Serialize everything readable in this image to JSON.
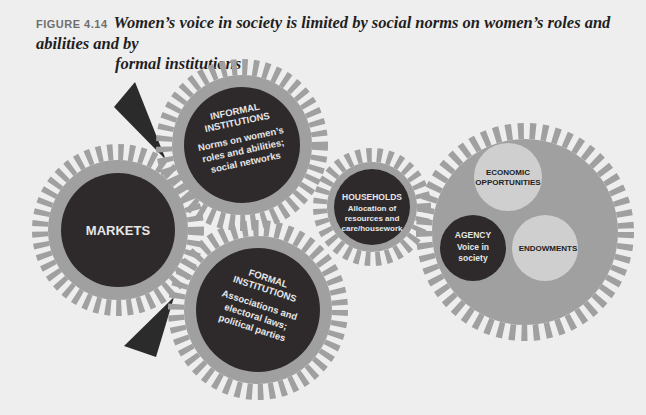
{
  "figure": {
    "label": "FIGURE 4.14",
    "caption_line1": "Women’s voice in society is limited by social norms on women’s roles and abilities and by",
    "caption_line2": "formal institutions"
  },
  "gears": {
    "markets": {
      "title": "MARKETS"
    },
    "informal": {
      "title_line1": "INFORMAL",
      "title_line2": "INSTITUTIONS",
      "desc_line1": "Norms on women’s",
      "desc_line2": "roles and abilities;",
      "desc_line3": "social networks"
    },
    "formal": {
      "title_line1": "FORMAL",
      "title_line2": "INSTITUTIONS",
      "desc_line1": "Associations and",
      "desc_line2": "electoral laws;",
      "desc_line3": "political parties"
    },
    "households": {
      "title": "HOUSEHOLDS",
      "desc_line1": "Allocation of",
      "desc_line2": "resources and",
      "desc_line3": "care/housework"
    },
    "outcomes": {
      "economic_line1": "ECONOMIC",
      "economic_line2": "OPPORTUNITIES",
      "agency_title": "AGENCY",
      "agency_desc_line1": "Voice in",
      "agency_desc_line2": "society",
      "endowments": "ENDOWMENTS"
    }
  },
  "colors": {
    "background": "#eeeeee",
    "gear_gray": "#a0a0a0",
    "dark_circle": "#2e2a2c",
    "light_circle": "#cfcfcf",
    "arrow": "#2b2b2b"
  }
}
